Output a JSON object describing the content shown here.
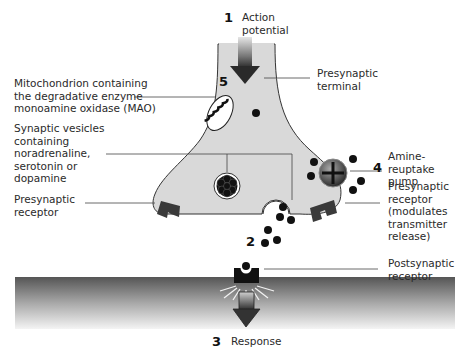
{
  "diagram": {
    "steps": [
      {
        "number": "1",
        "label": "Action\npotential"
      },
      {
        "number": "2",
        "label": ""
      },
      {
        "number": "3",
        "label": "Response"
      },
      {
        "number": "4",
        "label": "Amine-reuptake\npump"
      },
      {
        "number": "5",
        "label": ""
      }
    ],
    "labels": {
      "presynaptic_terminal": "Presynaptic\nterminal",
      "mitochondrion": "Mitochondrion containing\nthe degradative enzyme\nmonoamine oxidase (MAO)",
      "vesicles": "Synaptic vesicles\ncontaining\nnoradrenaline,\nserotonin or\ndopamine",
      "presynaptic_receptor_left": "Presynaptic\nreceptor",
      "presynaptic_receptor_right": "Presynaptic\nreceptor\n(modulates\ntransmitter\nrelease)",
      "postsynaptic_receptor": "Postsynaptic\nreceptor"
    },
    "colors": {
      "terminal_fill": "#d9d9d9",
      "terminal_stroke": "#333333",
      "dark": "#111111",
      "receptor": "#3a3a3a",
      "membrane_top": "#555555",
      "membrane_bottom": "#f2f2f2"
    }
  }
}
